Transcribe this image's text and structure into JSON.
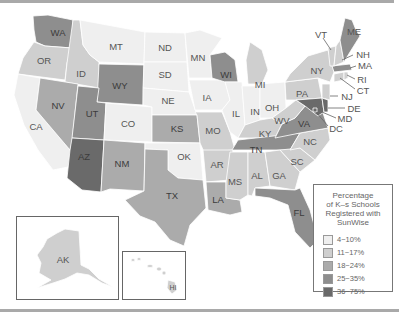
{
  "legend": {
    "title_lines": [
      "Percentage",
      "of K–s Schools",
      "Registered with",
      "SunWise"
    ],
    "items": [
      {
        "label": "4~10%",
        "color": "#efefef"
      },
      {
        "label": "11~17%",
        "color": "#cfcfcf"
      },
      {
        "label": "18~24%",
        "color": "#ababab"
      },
      {
        "label": "25~35%",
        "color": "#8e8e8e"
      },
      {
        "label": "36~75%",
        "color": "#6a6a6a"
      }
    ]
  },
  "states": {
    "WA": "25~35%",
    "OR": "11~17%",
    "CA": "4~10%",
    "ID": "11~17%",
    "NV": "18~24%",
    "MT": "4~10%",
    "WY": "25~35%",
    "UT": "25~35%",
    "AZ": "36~75%",
    "CO": "4~10%",
    "NM": "18~24%",
    "ND": "4~10%",
    "SD": "4~10%",
    "NE": "4~10%",
    "KS": "18~24%",
    "OK": "4~10%",
    "TX": "18~24%",
    "MN": "4~10%",
    "IA": "4~10%",
    "MO": "11~17%",
    "AR": "11~17%",
    "LA": "18~24%",
    "WI": "25~35%",
    "IL": "4~10%",
    "MS": "11~17%",
    "MI": "11~17%",
    "IN": "4~10%",
    "OH": "4~10%",
    "KY": "11~17%",
    "TN": "25~35%",
    "AL": "11~17%",
    "GA": "11~17%",
    "FL": "25~35%",
    "SC": "11~17%",
    "NC": "11~17%",
    "VA": "25~35%",
    "WV": "11~17%",
    "PA": "11~17%",
    "NY": "11~17%",
    "NJ": "11~17%",
    "DE": "36~75%",
    "MD": "36~75%",
    "DC": "36~75%",
    "CT": "11~17%",
    "RI": "11~17%",
    "MA": "25~35%",
    "NH": "11~17%",
    "VT": "11~17%",
    "ME": "25~35%",
    "AK": "11~17%",
    "HI": "11~17%"
  },
  "labels": {
    "WA": "WA",
    "OR": "OR",
    "CA": "CA",
    "ID": "ID",
    "NV": "NV",
    "MT": "MT",
    "WY": "WY",
    "UT": "UT",
    "AZ": "AZ",
    "CO": "CO",
    "NM": "NM",
    "ND": "ND",
    "SD": "SD",
    "NE": "NE",
    "KS": "KS",
    "OK": "OK",
    "TX": "TX",
    "MN": "MN",
    "IA": "IA",
    "MO": "MO",
    "AR": "AR",
    "LA": "LA",
    "WI": "WI",
    "IL": "IL",
    "MS": "MS",
    "MI": "MI",
    "IN": "IN",
    "OH": "OH",
    "KY": "KY",
    "TN": "TN",
    "AL": "AL",
    "GA": "GA",
    "FL": "FL",
    "SC": "SC",
    "NC": "NC",
    "VA": "VA",
    "WV": "WV",
    "PA": "PA",
    "NY": "NY",
    "NJ": "NJ",
    "DE": "DE",
    "MD": "MD",
    "DC": "DC",
    "CT": "CT",
    "RI": "RI",
    "MA": "MA",
    "NH": "NH",
    "VT": "VT",
    "ME": "ME",
    "AK": "AK",
    "HI": "HI"
  }
}
